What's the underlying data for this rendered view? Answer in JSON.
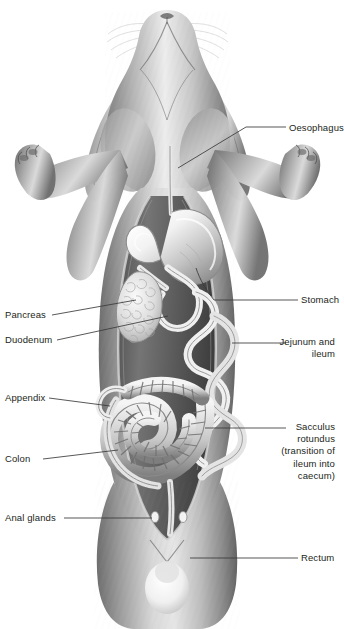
{
  "figure": {
    "style": "grayscale-medical-illustration",
    "background_color": "#ffffff",
    "label_color": "#231f20",
    "leader_color": "#3a3a3a"
  },
  "labels": {
    "oesophagus": "Oesophagus",
    "stomach": "Stomach",
    "jejunum_ileum": "Jejunum and\nileum",
    "sacculus": "Sacculus\nrotundus\n(transition of\nileum into\ncaecum)",
    "rectum": "Rectum",
    "pancreas": "Pancreas",
    "duodenum": "Duodenum",
    "appendix": "Appendix",
    "colon": "Colon",
    "anal_glands": "Anal glands"
  }
}
